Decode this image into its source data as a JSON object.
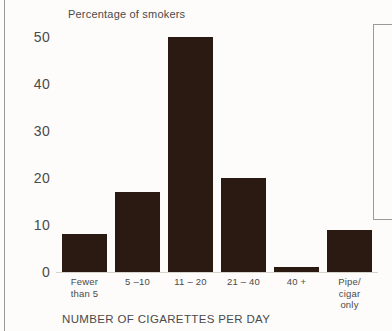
{
  "chart_data": {
    "type": "bar",
    "title": "Percentage of smokers",
    "xlabel": "NUMBER OF CIGARETTES PER DAY",
    "ylabel": "",
    "categories": [
      "Fewer than 5",
      "5 – 10",
      "11 – 20",
      "21 – 40",
      "40 +",
      "Pipe/ cigar only"
    ],
    "category_lines": [
      [
        "Fewer",
        "than 5"
      ],
      [
        "5 –10"
      ],
      [
        "11 – 20"
      ],
      [
        "21 – 40"
      ],
      [
        "40 +"
      ],
      [
        "Pipe/",
        "cigar",
        "only"
      ]
    ],
    "values": [
      8,
      17,
      50,
      20,
      1,
      9
    ],
    "ylim": [
      0,
      50
    ],
    "yticks": [
      0,
      10,
      20,
      30,
      40,
      50
    ],
    "ytick_labels": [
      "0",
      "10",
      "20",
      "30",
      "40",
      "50"
    ],
    "grid": false,
    "legend": false,
    "bar_color": "#2b1a12",
    "background_color": "#fdfcfa",
    "text_color": "#4a4a4a"
  }
}
